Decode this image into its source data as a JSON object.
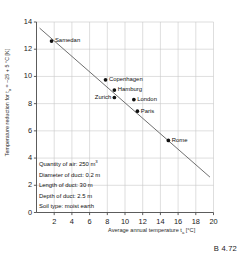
{
  "caption": "B 4.72",
  "chart_data": {
    "type": "scatter",
    "title": "",
    "xlabel_full": "Average annual temperature tₐ [°C]",
    "xlabel_prefix": "Average annual temperature t",
    "xlabel_sub": "a",
    "xlabel_suffix": " [°C]",
    "ylabel_full": "Temperature reduction for tₐ = -25 + 5 °C [K]",
    "ylabel_prefix": "Temperature reduction for t",
    "ylabel_sub": "a",
    "ylabel_suffix": " = –25 + 5 °C [K]",
    "xlim": [
      0,
      20
    ],
    "ylim": [
      0,
      14
    ],
    "xticks": [
      2,
      4,
      6,
      8,
      10,
      12,
      14,
      16,
      18,
      20
    ],
    "yticks": [
      0,
      2,
      4,
      6,
      8,
      10,
      12,
      14
    ],
    "grid": true,
    "legend_position": "none",
    "point_color": "#111111",
    "line_color": "#555555",
    "grid_color": "#c8c8c8",
    "axis_color": "#4a4a4a",
    "points": [
      {
        "name": "Samedan",
        "x": 1.7,
        "y": 12.6,
        "label_side": "right"
      },
      {
        "name": "Copenhagen",
        "x": 7.8,
        "y": 9.75,
        "label_side": "right"
      },
      {
        "name": "Hamburg",
        "x": 8.8,
        "y": 9.0,
        "label_side": "right"
      },
      {
        "name": "Zurich",
        "x": 8.8,
        "y": 8.45,
        "label_side": "left"
      },
      {
        "name": "London",
        "x": 11.0,
        "y": 8.3,
        "label_side": "right"
      },
      {
        "name": "Paris",
        "x": 11.4,
        "y": 7.45,
        "label_side": "right"
      },
      {
        "name": "Rome",
        "x": 14.9,
        "y": 5.3,
        "label_side": "right"
      }
    ],
    "trendline": {
      "x0": 0.35,
      "y0": 13.55,
      "x1": 19.6,
      "y1": 2.6
    },
    "annotations": [
      "Quantity of air: 250 m³",
      "Diameter of duct: 0.2 m",
      "Length of duct: 30 m",
      "Depth of duct: 2.5 m",
      "Soil type: moist earth"
    ]
  },
  "legend_box": {
    "lines": [
      {
        "text": "Quantity of air: 250 m",
        "sup": "3"
      },
      {
        "text": "Diameter of duct: 0.2 m",
        "sup": ""
      },
      {
        "text": "Length of duct: 30 m",
        "sup": ""
      },
      {
        "text": "Depth of duct: 2.5 m",
        "sup": ""
      },
      {
        "text": "Soil type: moist earth",
        "sup": ""
      }
    ]
  }
}
